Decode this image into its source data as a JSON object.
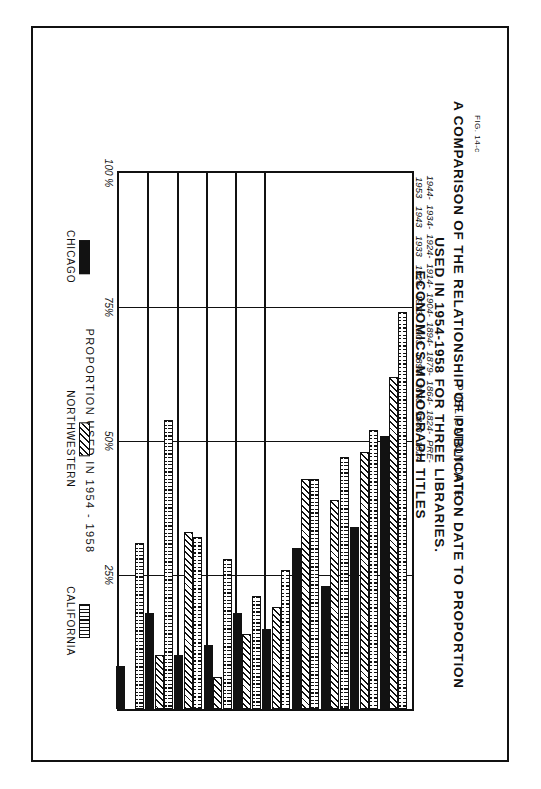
{
  "figure": {
    "number": "FIG. 14-c",
    "title_line1": "A COMPARISON OF THE RELATIONSHIP OF PUBLICATION DATE  TO  PROPORTION",
    "title_line2": "USED IN 1954-1958 FOR THREE LIBRARIES.",
    "title_line3": "ECONOMICS MONOGRAPH TITLES"
  },
  "chart_data": {
    "type": "bar",
    "orientation": "horizontal",
    "title": "A COMPARISON OF THE RELATIONSHIP OF PUBLICATION DATE TO PROPORTION USED IN 1954-1958 FOR THREE LIBRARIES. ECONOMICS MONOGRAPH TITLES",
    "xlabel": "PUBLICATION DATE",
    "ylabel": "PROPORTION USED  IN  1954 - 1958",
    "ylim": [
      0,
      100
    ],
    "yticks": [
      "25%",
      "50%",
      "75%",
      "100 %"
    ],
    "ytick_values": [
      25,
      50,
      75,
      100
    ],
    "grid": true,
    "legend_position": "bottom",
    "categories": [
      "PRE-\n1824",
      "1824-\n1863",
      "1864-\n1878",
      "1879-\n1893",
      "1894-\n1903",
      "1904-\n1913",
      "1914-\n1923",
      "1924-\n1933",
      "1934-\n1943",
      "1944-\n1953"
    ],
    "series": [
      {
        "name": "CHICAGO",
        "pattern": "solid-black",
        "values": [
          8,
          18,
          10,
          12,
          18,
          15,
          30,
          23,
          34,
          51
        ]
      },
      {
        "name": "NORTHWESTERN",
        "pattern": "diagonal-hatch",
        "values": [
          0,
          10,
          33,
          6,
          14,
          19,
          43,
          39,
          48,
          62
        ]
      },
      {
        "name": "CALIFORNIA",
        "pattern": "stipple-dots",
        "values": [
          31,
          54,
          32,
          28,
          21,
          26,
          43,
          47,
          52,
          74
        ]
      }
    ]
  },
  "categories": [
    {
      "top": "PRE-",
      "bottom": "1824"
    },
    {
      "top": "1824-",
      "bottom": "1863"
    },
    {
      "top": "1864-",
      "bottom": "1878"
    },
    {
      "top": "1879-",
      "bottom": "1893"
    },
    {
      "top": "1894-",
      "bottom": "1903"
    },
    {
      "top": "1904-",
      "bottom": "1913"
    },
    {
      "top": "1914-",
      "bottom": "1923"
    },
    {
      "top": "1924-",
      "bottom": "1933"
    },
    {
      "top": "1934-",
      "bottom": "1943"
    },
    {
      "top": "1944-",
      "bottom": "1953"
    }
  ],
  "axes": {
    "value_axis_title": "PROPORTION USED  IN  1954 - 1958",
    "category_axis_title": "PUBLICATION  DATE",
    "ticks": [
      "100 %",
      "75%",
      "50%",
      "25%"
    ]
  },
  "legend": [
    {
      "label": "CHICAGO",
      "pattern": "solid-black"
    },
    {
      "label": "NORTHWESTERN",
      "pattern": "diagonal-hatch"
    },
    {
      "label": "CALIFORNIA",
      "pattern": "stipple-dots"
    }
  ],
  "colors": {
    "ink": "#111111",
    "paper": "#ffffff"
  }
}
